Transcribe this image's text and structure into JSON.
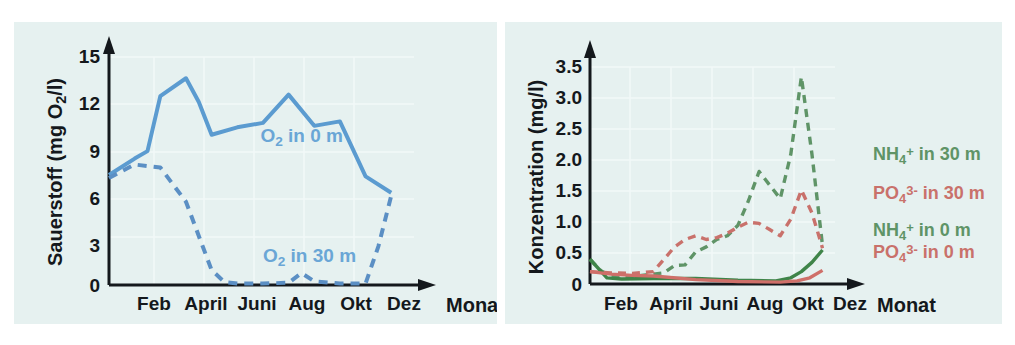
{
  "figure": {
    "background": "#ffffff",
    "panel_background": "#e6f1f0"
  },
  "chart_data": [
    {
      "id": "oxygen-chart",
      "type": "line",
      "title": "",
      "xlabel": "Monat",
      "ylabel": "Sauerstoff (mg O2/l)",
      "ylabel_parts": {
        "pre": "Sauerstoff (mg O",
        "sub": "2",
        "post": "/l)"
      },
      "ylim": [
        0,
        15.8
      ],
      "yticks": [
        "0",
        "3",
        "6",
        "9",
        "12",
        "15"
      ],
      "ytick_values": [
        0,
        3,
        6,
        9,
        12,
        15
      ],
      "xticks": [
        "Feb",
        "April",
        "Juni",
        "Aug",
        "Okt",
        "Dez"
      ],
      "xtick_values": [
        2,
        4,
        6,
        8,
        10,
        12
      ],
      "xlim": [
        1,
        13.2
      ],
      "grid": true,
      "legend_position": "inside-plot",
      "series": [
        {
          "name": "O2 in 0 m",
          "label_parts": {
            "pre": "O",
            "sub": "2",
            "post": " in 0 m"
          },
          "color": "#5b9bd0",
          "style": "solid",
          "x": [
            1,
            2,
            2.5,
            3,
            4,
            4.5,
            5,
            6,
            7,
            8,
            9,
            10,
            11,
            12
          ],
          "values": [
            7.4,
            8.5,
            9.0,
            12.7,
            13.9,
            12.3,
            10.1,
            10.6,
            10.9,
            12.8,
            10.7,
            11.0,
            7.3,
            6.2
          ],
          "label_x": 6.9,
          "label_y": 9.6
        },
        {
          "name": "O2 in 30 m",
          "label_parts": {
            "pre": "O",
            "sub": "2",
            "post": " in 30 m"
          },
          "color": "#5b8fc4",
          "style": "dashed",
          "x": [
            1,
            2,
            3,
            4,
            5,
            5.5,
            6,
            7,
            8,
            8.5,
            9,
            10,
            11,
            11.5,
            12
          ],
          "values": [
            7.2,
            8.1,
            7.9,
            5.6,
            1.0,
            0.2,
            0.1,
            0.1,
            0.15,
            0.8,
            0.25,
            0.1,
            0.1,
            2.6,
            6.0
          ],
          "label_x": 7.0,
          "label_y": 1.55
        }
      ]
    },
    {
      "id": "concentration-chart",
      "type": "line",
      "title": "",
      "xlabel": "Monat",
      "ylabel": "Konzentration (mg/l)",
      "ylim": [
        0,
        3.72
      ],
      "yticks": [
        "0",
        "0.5",
        "1.0",
        "1.5",
        "2.0",
        "2.5",
        "3.0",
        "3.5"
      ],
      "ytick_values": [
        0,
        0.5,
        1.0,
        1.5,
        2.0,
        2.5,
        3.0,
        3.5
      ],
      "xticks": [
        "Feb",
        "April",
        "Juni",
        "Aug",
        "Okt",
        "Dez"
      ],
      "xtick_values": [
        2,
        4,
        6,
        8,
        10,
        12
      ],
      "xlim": [
        1,
        13.3
      ],
      "grid": true,
      "legend_position": "right",
      "series": [
        {
          "name": "NH4+ in 30 m",
          "label_parts": {
            "pre": "NH",
            "sub": "4",
            "sup": "+",
            "post": " in 30 m"
          },
          "color": "#5f9467",
          "style": "dashed",
          "x": [
            1,
            1.5,
            2,
            3,
            4,
            4.5,
            5,
            5.5,
            6,
            6.5,
            7,
            7.5,
            8,
            8.5,
            9,
            9.5,
            10,
            10.5,
            11,
            11.5,
            12
          ],
          "values": [
            0.4,
            0.22,
            0.12,
            0.12,
            0.16,
            0.18,
            0.3,
            0.31,
            0.52,
            0.6,
            0.72,
            0.78,
            0.95,
            1.35,
            1.82,
            1.6,
            1.38,
            2.1,
            3.35,
            2.1,
            0.62
          ],
          "legend_y": 2.0
        },
        {
          "name": "PO43- in 30 m",
          "label_parts": {
            "pre": "PO",
            "sub": "4",
            "sup": "3-",
            "post": " in 30 m"
          },
          "color": "#c9716b",
          "style": "dashed",
          "x": [
            1,
            2,
            3,
            4,
            4.5,
            5,
            5.5,
            6,
            6.5,
            7,
            7.5,
            8,
            8.5,
            9,
            9.5,
            10,
            10.5,
            11,
            11.5,
            12
          ],
          "values": [
            0.2,
            0.18,
            0.17,
            0.2,
            0.4,
            0.6,
            0.72,
            0.78,
            0.72,
            0.75,
            0.82,
            0.92,
            1.0,
            0.98,
            0.88,
            0.78,
            1.05,
            1.52,
            1.15,
            0.58
          ],
          "legend_y": 1.38
        },
        {
          "name": "NH4+ in 0 m",
          "label_parts": {
            "pre": "NH",
            "sub": "4",
            "sup": "+",
            "post": " in 0 m"
          },
          "color": "#3f8449",
          "style": "solid",
          "x": [
            1,
            1.8,
            2.5,
            4,
            6,
            8,
            9.8,
            10.5,
            11,
            11.5,
            12
          ],
          "values": [
            0.4,
            0.1,
            0.08,
            0.09,
            0.09,
            0.06,
            0.05,
            0.1,
            0.2,
            0.35,
            0.55
          ],
          "legend_y": 0.78
        },
        {
          "name": "PO43- in 0 m",
          "label_parts": {
            "pre": "PO",
            "sub": "4",
            "sup": "3-",
            "post": " in 0 m"
          },
          "color": "#cf6f69",
          "style": "solid",
          "x": [
            1,
            2,
            3,
            4,
            6,
            8,
            10,
            10.8,
            11.4,
            12
          ],
          "values": [
            0.2,
            0.16,
            0.14,
            0.13,
            0.07,
            0.04,
            0.03,
            0.05,
            0.1,
            0.22
          ],
          "legend_y": 0.42
        }
      ]
    }
  ]
}
